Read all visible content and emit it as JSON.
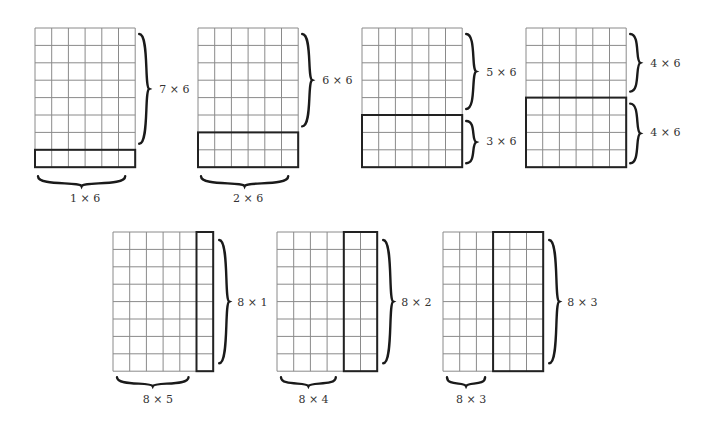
{
  "figure": {
    "cell_w": 16.7,
    "cell_h": 17.4,
    "grid_color": "#8a8a8a",
    "highlight_color": "#222222",
    "top_row": [
      {
        "id": "g1",
        "x": 35,
        "y": 28,
        "cols": 6,
        "rows": 8,
        "highlight": {
          "type": "rows",
          "from": 7,
          "count": 1
        },
        "upper_label": "7 × 6",
        "lower_label": "1 × 6",
        "upper_brace": "right",
        "lower_brace": "bottom"
      },
      {
        "id": "g2",
        "x": 198,
        "y": 28,
        "cols": 6,
        "rows": 8,
        "highlight": {
          "type": "rows",
          "from": 6,
          "count": 2
        },
        "upper_label": "6 × 6",
        "lower_label": "2 × 6",
        "upper_brace": "right",
        "lower_brace": "bottom"
      },
      {
        "id": "g3",
        "x": 362,
        "y": 28,
        "cols": 6,
        "rows": 8,
        "highlight": {
          "type": "rows",
          "from": 5,
          "count": 3
        },
        "upper_label": "5 × 6",
        "lower_label": "3 × 6",
        "upper_brace": "right",
        "lower_brace": "right"
      },
      {
        "id": "g4",
        "x": 526,
        "y": 28,
        "cols": 6,
        "rows": 8,
        "highlight": {
          "type": "rows",
          "from": 4,
          "count": 4
        },
        "upper_label": "4 × 6",
        "lower_label": "4 × 6",
        "upper_brace": "right",
        "lower_brace": "right"
      }
    ],
    "bottom_row": [
      {
        "id": "g5",
        "x": 113,
        "y": 232,
        "cols": 6,
        "rows": 8,
        "highlight": {
          "type": "cols",
          "from": 5,
          "count": 1
        },
        "right_label": "8 × 1",
        "bottom_label": "8 × 5"
      },
      {
        "id": "g6",
        "x": 277,
        "y": 232,
        "cols": 6,
        "rows": 8,
        "highlight": {
          "type": "cols",
          "from": 4,
          "count": 2
        },
        "right_label": "8 × 2",
        "bottom_label": "8 × 4"
      },
      {
        "id": "g7",
        "x": 443,
        "y": 232,
        "cols": 6,
        "rows": 8,
        "highlight": {
          "type": "cols",
          "from": 3,
          "count": 3
        },
        "right_label": "8 × 3",
        "bottom_label": "8 × 3"
      }
    ]
  }
}
